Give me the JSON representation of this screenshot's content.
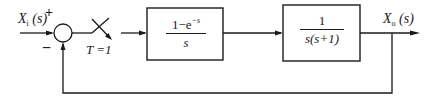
{
  "diagram": {
    "type": "sampled-data closed-loop block diagram",
    "input": {
      "symbol": "X",
      "subscript": "i",
      "arg": "(s)"
    },
    "output": {
      "symbol": "X",
      "subscript": "o",
      "arg": "(s)"
    },
    "summing_junction": {
      "plus_sign": "+",
      "minus_sign": "−"
    },
    "sampler": {
      "label": "T =1"
    },
    "blocks": [
      {
        "id": "zoh",
        "numerator": "1−e",
        "numerator_exp": "−s",
        "denominator": "s"
      },
      {
        "id": "plant",
        "numerator": "1",
        "denominator": "s(s+1)"
      }
    ],
    "feedback": "unity negative feedback"
  }
}
